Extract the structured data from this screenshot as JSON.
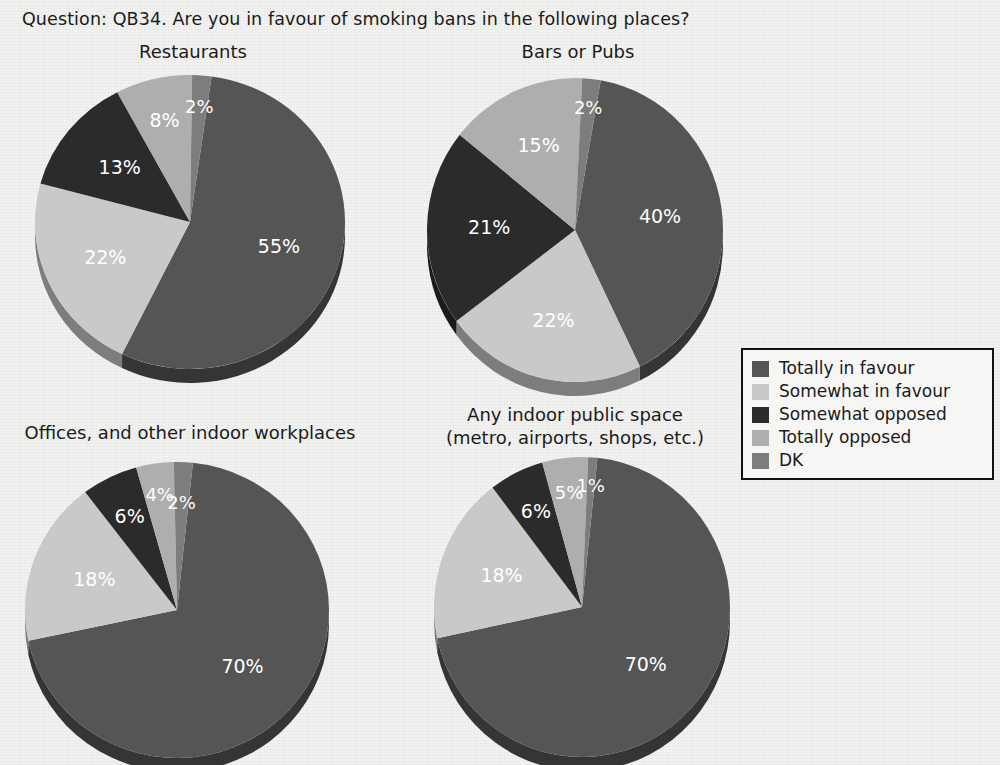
{
  "question": {
    "text": "Question: QB34.  Are you in favour of smoking bans in the following places?"
  },
  "legend": {
    "items": [
      {
        "label": "Totally in favour",
        "color": "#555555"
      },
      {
        "label": "Somewhat in favour",
        "color": "#c9c9c9"
      },
      {
        "label": "Somewhat opposed",
        "color": "#2b2b2b"
      },
      {
        "label": "Totally opposed",
        "color": "#aeaeae"
      },
      {
        "label": "DK",
        "color": "#7d7d7d"
      }
    ]
  },
  "chart_data": [
    {
      "type": "pie",
      "title": "Restaurants",
      "categories": [
        "Totally in favour",
        "Somewhat in favour",
        "Somewhat opposed",
        "Totally opposed",
        "DK"
      ],
      "values": [
        55,
        22,
        13,
        8,
        2
      ],
      "labels": [
        "55%",
        "22%",
        "13%",
        "8%",
        "2%"
      ],
      "colors": [
        "#555555",
        "#c9c9c9",
        "#2b2b2b",
        "#aeaeae",
        "#7d7d7d"
      ],
      "legend_position": "right-middle"
    },
    {
      "type": "pie",
      "title": "Bars or Pubs",
      "categories": [
        "Totally in favour",
        "Somewhat in favour",
        "Somewhat opposed",
        "Totally opposed",
        "DK"
      ],
      "values": [
        40,
        22,
        21,
        15,
        2
      ],
      "labels": [
        "40%",
        "22%",
        "21%",
        "15%",
        "2%"
      ],
      "colors": [
        "#555555",
        "#c9c9c9",
        "#2b2b2b",
        "#aeaeae",
        "#7d7d7d"
      ],
      "legend_position": "right-middle"
    },
    {
      "type": "pie",
      "title": "Offices, and other indoor workplaces",
      "categories": [
        "Totally in favour",
        "Somewhat in favour",
        "Somewhat opposed",
        "Totally opposed",
        "DK"
      ],
      "values": [
        70,
        18,
        6,
        4,
        2
      ],
      "labels": [
        "70%",
        "18%",
        "6%",
        "4%",
        "2%"
      ],
      "colors": [
        "#555555",
        "#c9c9c9",
        "#2b2b2b",
        "#aeaeae",
        "#7d7d7d"
      ],
      "legend_position": "right-middle"
    },
    {
      "type": "pie",
      "title": "Any indoor public space\n(metro, airports, shops, etc.)",
      "title_line1": "Any indoor public space",
      "title_line2": "(metro, airports, shops, etc.)",
      "categories": [
        "Totally in favour",
        "Somewhat in favour",
        "Somewhat opposed",
        "Totally opposed",
        "DK"
      ],
      "values": [
        70,
        18,
        6,
        5,
        1
      ],
      "labels": [
        "70%",
        "18%",
        "6%",
        "5%",
        "1%"
      ],
      "colors": [
        "#555555",
        "#c9c9c9",
        "#2b2b2b",
        "#aeaeae",
        "#7d7d7d"
      ],
      "legend_position": "right-middle"
    }
  ]
}
